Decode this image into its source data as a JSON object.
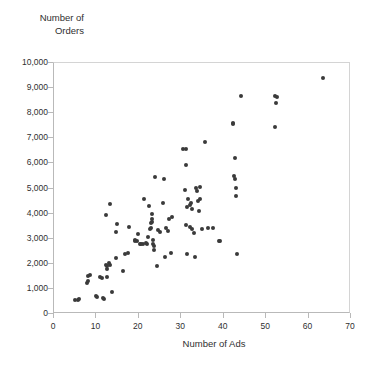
{
  "chart_data": {
    "type": "scatter",
    "title": "",
    "xlabel": "Number of Ads",
    "ylabel": "Number of\nOrders",
    "xlim": [
      0,
      70
    ],
    "ylim": [
      0,
      10000
    ],
    "grid": false,
    "legend": null,
    "marker": {
      "shape": "circle",
      "color": "#3a3a3a",
      "size": 4
    },
    "xticks": [
      0,
      10,
      20,
      30,
      40,
      50,
      60,
      70
    ],
    "xtick_labels": [
      "0",
      "10",
      "20",
      "30",
      "40",
      "50",
      "60",
      "70"
    ],
    "yticks": [
      0,
      1000,
      2000,
      3000,
      4000,
      5000,
      6000,
      7000,
      8000,
      9000,
      10000
    ],
    "ytick_labels": [
      "0",
      "1,000",
      "2,000",
      "3,000",
      "4,000",
      "5,000",
      "6,000",
      "7,000",
      "8,000",
      "9,000",
      "10,000"
    ],
    "n_points": 104,
    "points": [
      [
        5.0,
        560
      ],
      [
        5.6,
        570
      ],
      [
        6.0,
        580
      ],
      [
        7.8,
        1230
      ],
      [
        7.9,
        1310
      ],
      [
        8.1,
        1530
      ],
      [
        8.6,
        1560
      ],
      [
        9.9,
        700
      ],
      [
        10.1,
        680
      ],
      [
        11.5,
        620
      ],
      [
        11.9,
        610
      ],
      [
        10.9,
        1460
      ],
      [
        11.4,
        1430
      ],
      [
        12.3,
        1960
      ],
      [
        12.4,
        1900
      ],
      [
        12.5,
        1780
      ],
      [
        12.6,
        1490
      ],
      [
        13.0,
        2020
      ],
      [
        13.1,
        1960
      ],
      [
        13.7,
        880
      ],
      [
        13.3,
        4380
      ],
      [
        12.2,
        3930
      ],
      [
        14.6,
        2220
      ],
      [
        14.7,
        3250
      ],
      [
        14.8,
        3590
      ],
      [
        16.3,
        1700
      ],
      [
        16.8,
        2390
      ],
      [
        17.4,
        2450
      ],
      [
        17.7,
        3470
      ],
      [
        19.0,
        2960
      ],
      [
        19.2,
        2890
      ],
      [
        19.5,
        2900
      ],
      [
        19.8,
        3180
      ],
      [
        20.3,
        2790
      ],
      [
        20.6,
        2800
      ],
      [
        21.0,
        2800
      ],
      [
        21.2,
        4600
      ],
      [
        21.8,
        2810
      ],
      [
        22.0,
        2780
      ],
      [
        22.2,
        3060
      ],
      [
        22.4,
        4290
      ],
      [
        22.7,
        3400
      ],
      [
        22.8,
        3440
      ],
      [
        22.9,
        3620
      ],
      [
        23.0,
        3680
      ],
      [
        23.1,
        3780
      ],
      [
        23.2,
        3980
      ],
      [
        23.3,
        2960
      ],
      [
        23.4,
        2790
      ],
      [
        23.5,
        2560
      ],
      [
        23.6,
        2720
      ],
      [
        24.2,
        1930
      ],
      [
        24.6,
        3340
      ],
      [
        25.0,
        3260
      ],
      [
        25.8,
        4410
      ],
      [
        26.1,
        2270
      ],
      [
        26.4,
        3410
      ],
      [
        26.8,
        3320
      ],
      [
        27.2,
        3800
      ],
      [
        27.9,
        3860
      ],
      [
        27.6,
        2440
      ],
      [
        23.9,
        5470
      ],
      [
        26.0,
        5370
      ],
      [
        30.4,
        6560
      ],
      [
        31.2,
        6570
      ],
      [
        31.0,
        5930
      ],
      [
        30.9,
        4940
      ],
      [
        31.3,
        4280
      ],
      [
        31.0,
        3560
      ],
      [
        31.4,
        2400
      ],
      [
        31.6,
        4580
      ],
      [
        32.0,
        4360
      ],
      [
        32.3,
        4420
      ],
      [
        32.6,
        4190
      ],
      [
        32.1,
        3480
      ],
      [
        32.6,
        3370
      ],
      [
        33.0,
        3220
      ],
      [
        33.4,
        5020
      ],
      [
        33.7,
        4900
      ],
      [
        34.0,
        4520
      ],
      [
        34.5,
        4600
      ],
      [
        34.2,
        4100
      ],
      [
        34.8,
        3400
      ],
      [
        33.2,
        2290
      ],
      [
        35.6,
        6860
      ],
      [
        36.2,
        3430
      ],
      [
        37.4,
        3420
      ],
      [
        34.3,
        5070
      ],
      [
        38.8,
        2920
      ],
      [
        39.2,
        2900
      ],
      [
        42.1,
        7620
      ],
      [
        42.3,
        7560
      ],
      [
        42.6,
        6230
      ],
      [
        42.4,
        5490
      ],
      [
        42.7,
        5370
      ],
      [
        42.9,
        5010
      ],
      [
        42.8,
        4700
      ],
      [
        43.2,
        2400
      ],
      [
        44.0,
        8670
      ],
      [
        52.1,
        8700
      ],
      [
        52.6,
        8660
      ],
      [
        52.4,
        8410
      ],
      [
        52.2,
        7440
      ],
      [
        63.4,
        9420
      ]
    ]
  }
}
